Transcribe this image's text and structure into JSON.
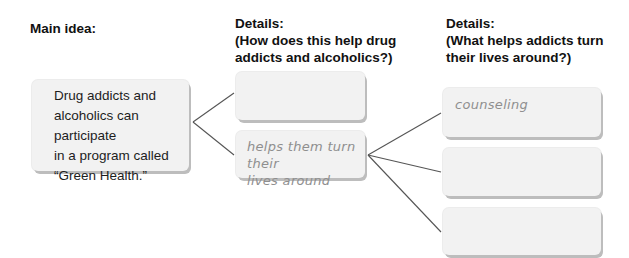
{
  "headings": {
    "main": "Main idea:",
    "details1_line1": "Details:",
    "details1_line2": "(How does this help drug",
    "details1_line3": "addicts and alcoholics?)",
    "details2_line1": "Details:",
    "details2_line2": "(What helps addicts turn",
    "details2_line3": "their lives around?)"
  },
  "main_idea": {
    "lines": [
      "Drug addicts and",
      "alcoholics can participate",
      "in a program called",
      "“Green Health.”"
    ]
  },
  "details1": [
    {
      "lines": [
        "",
        ""
      ]
    },
    {
      "lines": [
        "helps them turn their",
        "lives around"
      ]
    }
  ],
  "details2": [
    {
      "lines": [
        "counseling"
      ]
    },
    {
      "lines": [
        ""
      ]
    },
    {
      "lines": [
        ""
      ]
    }
  ],
  "colors": {
    "box_fill": "#f2f2f2",
    "box_shadow": "#bdbdbd",
    "connector": "#555555",
    "handwriting": "#8f8f8f"
  }
}
